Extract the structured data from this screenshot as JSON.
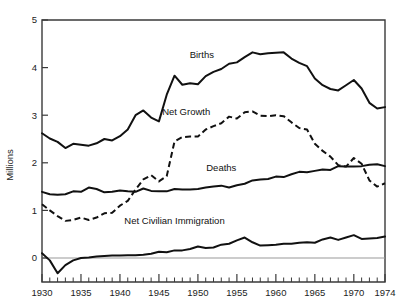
{
  "chart_data": {
    "type": "line",
    "title": "",
    "xlabel": "",
    "ylabel": "Millions",
    "xlim": [
      1930,
      1974
    ],
    "ylim": [
      -0.5,
      5
    ],
    "grid": false,
    "legend_position": "inline-annotations",
    "y_ticks": [
      "0",
      "1",
      "2",
      "3",
      "4",
      "5"
    ],
    "y_tick_values": [
      0,
      1,
      2,
      3,
      4,
      5
    ],
    "x_ticks": [
      "1930",
      "1935",
      "1940",
      "1945",
      "1950",
      "1955",
      "1960",
      "1965",
      "1970",
      "1974"
    ],
    "x_tick_values": [
      1930,
      1935,
      1940,
      1945,
      1950,
      1955,
      1960,
      1965,
      1970,
      1974
    ],
    "x": [
      1930,
      1931,
      1932,
      1933,
      1934,
      1935,
      1936,
      1937,
      1938,
      1939,
      1940,
      1941,
      1942,
      1943,
      1944,
      1945,
      1946,
      1947,
      1948,
      1949,
      1950,
      1951,
      1952,
      1953,
      1954,
      1955,
      1956,
      1957,
      1958,
      1959,
      1960,
      1961,
      1962,
      1963,
      1964,
      1965,
      1966,
      1967,
      1968,
      1969,
      1970,
      1971,
      1972,
      1973,
      1974
    ],
    "series": [
      {
        "name": "Births",
        "style": "solid",
        "color": "#111111",
        "values": [
          2.62,
          2.51,
          2.44,
          2.31,
          2.4,
          2.38,
          2.36,
          2.41,
          2.5,
          2.47,
          2.56,
          2.7,
          3.0,
          3.1,
          2.95,
          2.87,
          3.43,
          3.83,
          3.64,
          3.67,
          3.65,
          3.82,
          3.91,
          3.97,
          4.08,
          4.11,
          4.22,
          4.32,
          4.28,
          4.3,
          4.31,
          4.32,
          4.19,
          4.1,
          4.03,
          3.77,
          3.63,
          3.55,
          3.52,
          3.63,
          3.74,
          3.56,
          3.26,
          3.14,
          3.17
        ]
      },
      {
        "name": "Net Growth",
        "style": "dashed",
        "color": "#111111",
        "values": [
          1.13,
          1.0,
          0.88,
          0.78,
          0.8,
          0.85,
          0.8,
          0.85,
          0.94,
          0.95,
          1.1,
          1.2,
          1.44,
          1.65,
          1.74,
          1.61,
          1.72,
          2.45,
          2.54,
          2.55,
          2.55,
          2.7,
          2.77,
          2.83,
          2.97,
          2.93,
          3.06,
          3.08,
          2.99,
          2.98,
          3.0,
          2.98,
          2.85,
          2.73,
          2.7,
          2.4,
          2.25,
          2.13,
          1.95,
          1.92,
          2.1,
          1.98,
          1.63,
          1.5,
          1.57
        ]
      },
      {
        "name": "Deaths",
        "style": "solid",
        "color": "#111111",
        "values": [
          1.39,
          1.34,
          1.33,
          1.34,
          1.4,
          1.39,
          1.48,
          1.45,
          1.38,
          1.39,
          1.42,
          1.4,
          1.39,
          1.46,
          1.41,
          1.4,
          1.4,
          1.45,
          1.44,
          1.44,
          1.45,
          1.48,
          1.5,
          1.52,
          1.48,
          1.53,
          1.56,
          1.63,
          1.65,
          1.66,
          1.71,
          1.7,
          1.76,
          1.81,
          1.8,
          1.83,
          1.86,
          1.85,
          1.93,
          1.92,
          1.92,
          1.93,
          1.96,
          1.97,
          1.93
        ]
      },
      {
        "name": "Net Civilian Immigration",
        "style": "solid",
        "color": "#111111",
        "values": [
          0.1,
          -0.05,
          -0.32,
          -0.15,
          -0.05,
          0.0,
          0.01,
          0.03,
          0.04,
          0.05,
          0.05,
          0.06,
          0.06,
          0.07,
          0.09,
          0.13,
          0.12,
          0.16,
          0.16,
          0.19,
          0.24,
          0.21,
          0.22,
          0.28,
          0.3,
          0.37,
          0.43,
          0.33,
          0.26,
          0.27,
          0.28,
          0.3,
          0.3,
          0.32,
          0.33,
          0.32,
          0.39,
          0.43,
          0.38,
          0.43,
          0.48,
          0.4,
          0.41,
          0.42,
          0.45
        ]
      }
    ],
    "annotations": [
      {
        "text": "Births",
        "x": 1950.5,
        "y": 4.2
      },
      {
        "text": "Net Growth",
        "x": 1948.5,
        "y": 3.0
      },
      {
        "text": "Deaths",
        "x": 1953.0,
        "y": 1.82
      },
      {
        "text": "Net Civilian Immigration",
        "x": 1947.0,
        "y": 0.72
      }
    ]
  }
}
